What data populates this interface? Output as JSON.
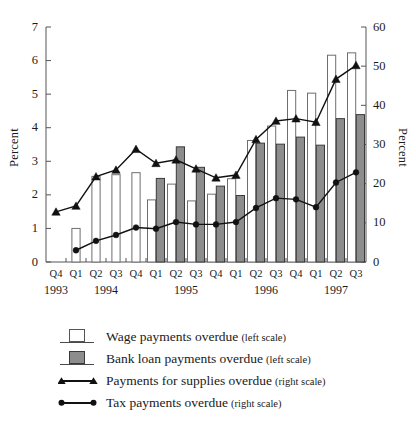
{
  "chart_data": {
    "type": "bar",
    "title": "",
    "subtitle": "",
    "xlabel": "",
    "ylabel": "Percent",
    "ylabel_right": "Percent",
    "ylim": [
      0,
      7
    ],
    "ylim_right": [
      0,
      60
    ],
    "yticks": [
      0,
      1,
      2,
      3,
      4,
      5,
      6,
      7
    ],
    "yticks_right": [
      0,
      10,
      20,
      30,
      40,
      50,
      60
    ],
    "grid": false,
    "legend_position": "below",
    "categories": [
      "Q4",
      "Q1",
      "Q2",
      "Q3",
      "Q4",
      "Q1",
      "Q2",
      "Q3",
      "Q4",
      "Q1",
      "Q2",
      "Q3",
      "Q4",
      "Q1",
      "Q2",
      "Q3"
    ],
    "year_groups": [
      {
        "label": "1993",
        "start": 0,
        "count": 1
      },
      {
        "label": "1994",
        "start": 1,
        "count": 4
      },
      {
        "label": "1995",
        "start": 5,
        "count": 4
      },
      {
        "label": "1996",
        "start": 9,
        "count": 4
      },
      {
        "label": "1997",
        "start": 13,
        "count": 3
      }
    ],
    "series": [
      {
        "name": "Wage payments overdue",
        "scale": "left",
        "type": "bar",
        "style": "white",
        "values": [
          null,
          1.0,
          2.55,
          2.6,
          2.66,
          1.85,
          2.32,
          1.82,
          2.02,
          2.48,
          3.62,
          4.05,
          5.11,
          5.03,
          6.16,
          6.23
        ]
      },
      {
        "name": "Bank loan payments overdue",
        "scale": "left",
        "type": "bar",
        "style": "gray",
        "values": [
          null,
          null,
          null,
          null,
          null,
          2.49,
          3.43,
          2.82,
          2.26,
          1.98,
          3.54,
          3.51,
          3.72,
          3.48,
          4.27,
          4.39
        ]
      },
      {
        "name": "Payments for supplies overdue",
        "scale": "right",
        "type": "line",
        "marker": "triangle",
        "values": [
          12.8,
          14.3,
          21.8,
          23.5,
          28.8,
          25.2,
          26.1,
          23.8,
          21.5,
          22.2,
          31.3,
          36.0,
          36.6,
          35.7,
          46.7,
          50.2
        ]
      },
      {
        "name": "Tax payments overdue",
        "scale": "right",
        "type": "line",
        "marker": "circle",
        "values": [
          null,
          3.0,
          5.4,
          6.9,
          8.8,
          8.5,
          10.2,
          9.6,
          9.6,
          10.2,
          13.8,
          16.3,
          16.0,
          14.0,
          20.3,
          22.9
        ]
      }
    ],
    "colors": {
      "bar_white_fill": "#ffffff",
      "bar_white_border": "#6e6e6e",
      "bar_gray_fill": "#8d8d8d",
      "bar_gray_border": "#3a3a3a",
      "line": "#111111",
      "axis": "#555555"
    }
  },
  "axes": {
    "left_title": "Percent",
    "right_title": "Percent"
  },
  "legend": {
    "items": [
      {
        "label": "Wage payments overdue",
        "scale_note": "(left scale)",
        "key": "white-square-key"
      },
      {
        "label": "Bank loan payments overdue",
        "scale_note": "(left scale)",
        "key": "gray-square-key"
      },
      {
        "label": "Payments for supplies overdue",
        "scale_note": "(right scale)",
        "key": "triangle-line-key"
      },
      {
        "label": "Tax payments overdue",
        "scale_note": "(right scale)",
        "key": "circle-line-key"
      }
    ]
  }
}
